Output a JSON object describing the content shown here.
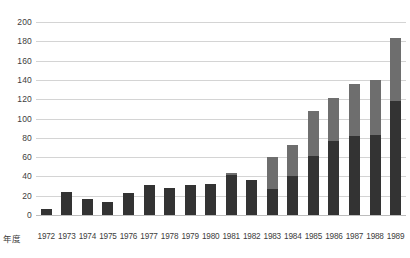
{
  "chart_data": {
    "type": "bar",
    "stacked": true,
    "title": "",
    "xlabel": "年度",
    "ylabel": "",
    "ylim": [
      0,
      200
    ],
    "ytick_step": 20,
    "yticks": [
      200,
      180,
      160,
      140,
      120,
      100,
      80,
      60,
      40,
      20,
      0
    ],
    "grid": true,
    "legend": "none",
    "categories": [
      "1972",
      "1973",
      "1974",
      "1975",
      "1976",
      "1977",
      "1978",
      "1979",
      "1980",
      "1981",
      "1982",
      "1983",
      "1984",
      "1985",
      "1986",
      "1987",
      "1988",
      "1989"
    ],
    "series": [
      {
        "name": "lower-segment",
        "color": "#333333",
        "values": [
          6,
          24,
          17,
          14,
          23,
          31,
          28,
          31,
          32,
          41,
          36,
          27,
          40,
          61,
          77,
          82,
          83,
          118
        ]
      },
      {
        "name": "upper-segment",
        "color": "#6e6e6e",
        "values": [
          0,
          0,
          0,
          0,
          0,
          0,
          0,
          0,
          0,
          3,
          0,
          33,
          33,
          47,
          44,
          54,
          57,
          65
        ]
      }
    ],
    "totals": [
      6,
      24,
      17,
      14,
      23,
      31,
      28,
      31,
      32,
      44,
      36,
      60,
      73,
      108,
      121,
      136,
      140,
      183
    ],
    "colors": {
      "bar_dark": "#333333",
      "bar_light": "#6e6e6e",
      "gridline": "#d4d4d4",
      "axis": "#bdbdbd",
      "text": "#3d3d3d",
      "background": "#ffffff"
    }
  },
  "axis": {
    "x_title": "年度"
  }
}
